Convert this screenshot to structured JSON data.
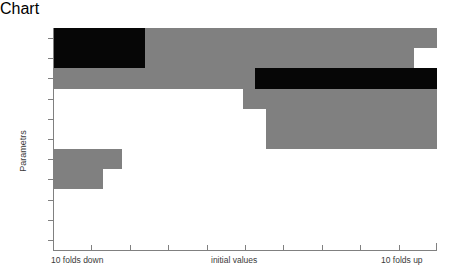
{
  "chart_data": {
    "type": "bar",
    "title": "",
    "subtitle": "",
    "xlabel": "",
    "ylabel": "Parametrs",
    "orientation": "horizontal",
    "grid": false,
    "legend": false,
    "xlim": [
      -10,
      10
    ],
    "xunits": "folds",
    "x_tick_labels": [
      "10 folds down",
      "initial values",
      "10 folds up"
    ],
    "x_tick_positions": [
      -10,
      0,
      10
    ],
    "x_minor_ticks": [
      -8,
      -6,
      -4,
      -2,
      2,
      4,
      6,
      8
    ],
    "categories": [
      "kB",
      "km1",
      "k1",
      "kmB",
      "kI",
      "I",
      "kA",
      "k2",
      "kmI",
      "km2",
      "kmA"
    ],
    "colors": {
      "grey": "#808080",
      "black": "#060606",
      "axis": "#808080",
      "text": "#3a3a3a",
      "background": "#ffffff"
    },
    "series": [
      {
        "name": "grey-band",
        "description": "sensitivity span (grey)",
        "values": [
          {
            "category": "kB",
            "start": -10.0,
            "end": 10.0
          },
          {
            "category": "km1",
            "start": -10.0,
            "end": 8.8
          },
          {
            "category": "k1",
            "start": -10.0,
            "end": 10.0
          },
          {
            "category": "kmB",
            "start": -0.1,
            "end": 10.0
          },
          {
            "category": "kI",
            "start": 1.1,
            "end": 10.0
          },
          {
            "category": "I",
            "start": 1.1,
            "end": 10.0
          },
          {
            "category": "kA",
            "start": -10.0,
            "end": -6.4
          },
          {
            "category": "k2",
            "start": -10.0,
            "end": -7.4
          },
          {
            "category": "kmI",
            "start": 0.0,
            "end": 0.0
          },
          {
            "category": "km2",
            "start": 0.0,
            "end": 0.0
          },
          {
            "category": "kmA",
            "start": 0.0,
            "end": 0.0
          }
        ]
      },
      {
        "name": "black-band",
        "description": "strong sensitivity span (black)",
        "values": [
          {
            "category": "kB",
            "start": -10.0,
            "end": -5.2
          },
          {
            "category": "km1",
            "start": -10.0,
            "end": -5.2
          },
          {
            "category": "k1",
            "start": 0.5,
            "end": 10.0
          },
          {
            "category": "kmB",
            "start": 0.0,
            "end": 0.0
          },
          {
            "category": "kI",
            "start": 0.0,
            "end": 0.0
          },
          {
            "category": "I",
            "start": 0.0,
            "end": 0.0
          },
          {
            "category": "kA",
            "start": 0.0,
            "end": 0.0
          },
          {
            "category": "k2",
            "start": 0.0,
            "end": 0.0
          },
          {
            "category": "kmI",
            "start": 0.0,
            "end": 0.0
          },
          {
            "category": "km2",
            "start": 0.0,
            "end": 0.0
          },
          {
            "category": "kmA",
            "start": 0.0,
            "end": 0.0
          }
        ]
      }
    ]
  },
  "axes": {
    "y_title": "Parametrs",
    "x_left_label": "10 folds down",
    "x_center_label": "initial values",
    "x_right_label": "10 folds up"
  }
}
